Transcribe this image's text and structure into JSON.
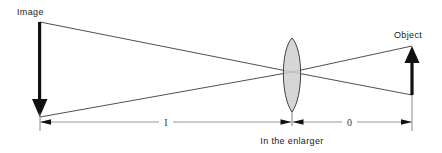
{
  "diagram": {
    "title": "In the enlarger",
    "type": "optical-ray-diagram",
    "canvas": {
      "width": 442,
      "height": 153,
      "background": "#ffffff"
    },
    "labels": {
      "image": "Image",
      "object": "Object",
      "caption": "In the enlarger",
      "image_distance": "I",
      "object_distance": "0"
    },
    "colors": {
      "ray": "#3b3b3b",
      "arrow": "#111111",
      "lens_fill": "#cfcfcf",
      "lens_stroke": "#2e2e2e",
      "dimension": "#8d8d8d",
      "text": "#1a1a1a"
    },
    "elements": {
      "image_arrow": {
        "name": "Image",
        "direction": "down",
        "x": 40,
        "top_y": 22,
        "tip_y": 117,
        "description": "Inverted projected image, arrow pointing down"
      },
      "object_arrow": {
        "name": "Object",
        "direction": "up",
        "x": 412,
        "base_y": 95,
        "tip_y": 46,
        "description": "Upright negative in the carrier, arrow pointing up"
      },
      "lens": {
        "name": "Enlarger lens",
        "shape": "biconvex",
        "center_x": 292,
        "center_y": 72,
        "top_y": 38,
        "bottom_y": 112,
        "half_width": 11
      },
      "rays": [
        {
          "name": "ray-top-to-bottom",
          "from": {
            "x": 40,
            "y": 22
          },
          "through": {
            "x": 292,
            "y": 72
          },
          "to": {
            "x": 412,
            "y": 95
          }
        },
        {
          "name": "ray-bottom-to-top",
          "from": {
            "x": 40,
            "y": 117
          },
          "through": {
            "x": 292,
            "y": 72
          },
          "to": {
            "x": 412,
            "y": 46
          }
        }
      ],
      "dimensions": [
        {
          "name": "image-distance",
          "label": "I",
          "from_x": 40,
          "to_x": 292,
          "y": 122,
          "label_x": 166
        },
        {
          "name": "object-distance",
          "label": "0",
          "from_x": 292,
          "to_x": 412,
          "y": 122,
          "label_x": 349
        }
      ]
    }
  }
}
